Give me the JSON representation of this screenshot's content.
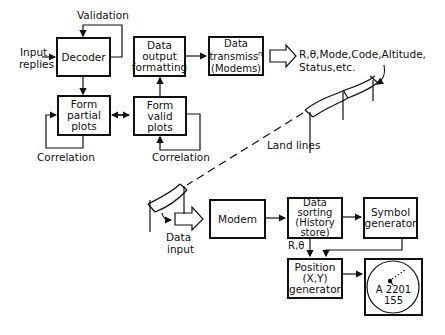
{
  "blocks": {
    "decoder": {
      "lines": [
        "Decoder"
      ]
    },
    "form_partial_plots": {
      "lines": [
        "Form",
        "partial",
        "plots"
      ]
    },
    "data_output_formatting": {
      "lines": [
        "Data",
        "output",
        "formatting"
      ]
    },
    "form_valid_plots": {
      "lines": [
        "Form",
        "valid",
        "plots"
      ]
    },
    "data_transmission": {
      "lines": [
        "Data",
        "transmiss",
        "(Modems)"
      ],
      "superscript": "n"
    },
    "modem": {
      "lines": [
        "Modem"
      ]
    },
    "data_sorting": {
      "lines": [
        "Data",
        "sorting",
        "(History",
        "store)"
      ]
    },
    "symbol_generator": {
      "lines": [
        "Symbol",
        "generator"
      ]
    },
    "position_generator": {
      "lines": [
        "Position",
        "(X,Y)",
        "generator"
      ]
    },
    "display": {
      "label_line1": "A 2201",
      "label_line2": "155"
    }
  },
  "labels": {
    "validation": "Validation",
    "input_replies_1": "Input",
    "input_replies_2": "replies",
    "correlation_left": "Correlation",
    "correlation_right": "Correlation",
    "output_data_1": "R,θ,Mode,Code,Altitude,",
    "output_data_2": "Status,etc.",
    "land_lines": "Land lines",
    "data_input_1": "Data",
    "data_input_2": "input",
    "r_theta": "R,θ"
  }
}
